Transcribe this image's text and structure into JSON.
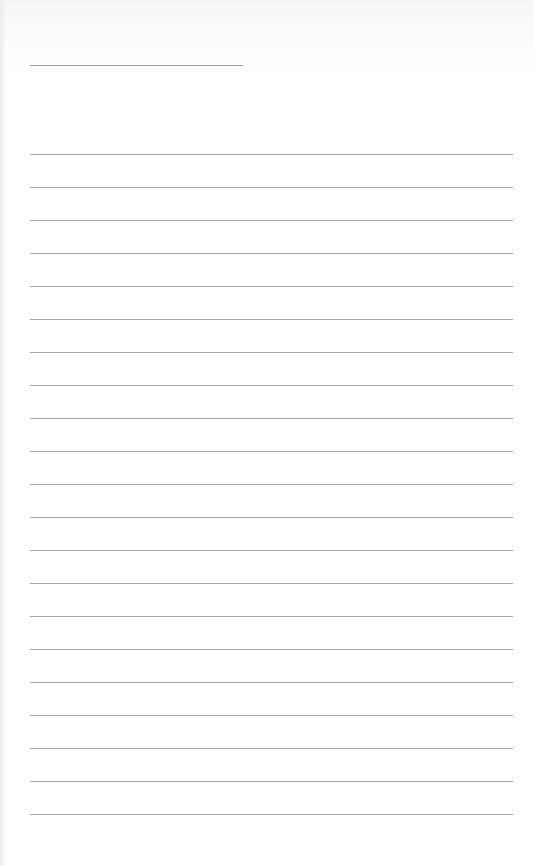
{
  "page": {
    "type": "lined-paper",
    "background_color": "#ffffff",
    "line_color": "#a8a8a8",
    "title_line": {
      "x": 30,
      "y": 65,
      "width": 213
    },
    "ruled_lines": {
      "count": 21,
      "first_y": 154,
      "spacing": 33,
      "x": 30,
      "width": 483
    }
  }
}
